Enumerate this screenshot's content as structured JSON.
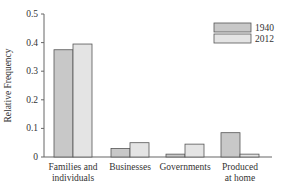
{
  "chart_data": {
    "type": "bar",
    "title": "",
    "xlabel": "",
    "ylabel": "Relative Frequency",
    "ylim": [
      0,
      0.5
    ],
    "yticks": [
      0,
      0.1,
      0.2,
      0.3,
      0.4,
      0.5
    ],
    "ytick_labels": [
      "0",
      "0.1",
      "0.2",
      "0.3",
      "0.4",
      "0.5"
    ],
    "grid": false,
    "legend_position": "upper right",
    "categories": [
      [
        "Families and",
        "individuals"
      ],
      [
        "Businesses"
      ],
      [
        "Governments"
      ],
      [
        "Produced",
        "at home"
      ]
    ],
    "series": [
      {
        "name": "1940",
        "color": "#c8c8c8",
        "values": [
          0.375,
          0.03,
          0.01,
          0.085
        ]
      },
      {
        "name": "2012",
        "color": "#e4e4e4",
        "values": [
          0.395,
          0.05,
          0.045,
          0.01
        ]
      }
    ]
  }
}
